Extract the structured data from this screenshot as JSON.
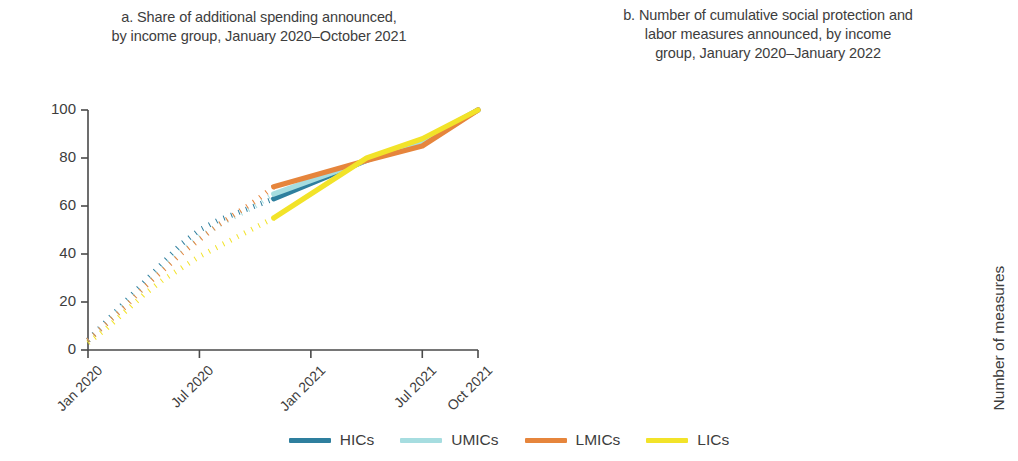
{
  "figure": {
    "background": "#ffffff"
  },
  "colors": {
    "HICs": "#2e7f9e",
    "UMICs": "#a6dde0",
    "LMICs": "#e6853c",
    "LICs": "#f2e329",
    "axis": "#4a4a4a",
    "text": "#3d3d3d"
  },
  "legend": {
    "position": "bottom-center",
    "items": [
      {
        "label": "HICs",
        "color": "#2e7f9e"
      },
      {
        "label": "UMICs",
        "color": "#a6dde0"
      },
      {
        "label": "LMICs",
        "color": "#e6853c"
      },
      {
        "label": "LICs",
        "color": "#f2e329"
      }
    ]
  },
  "panels": {
    "a": {
      "title_line1": "a. Share of additional spending announced,",
      "title_line2": "by income group, January 2020–October 2021"
    },
    "b": {
      "title_line1": "b. Number of cumulative social protection and",
      "title_line2": "labor measures announced, by income",
      "title_line3": "group, January 2020–January 2022"
    }
  },
  "chart_data": [
    {
      "id": "panel-a",
      "type": "line",
      "title": "a. Share of additional spending announced, by income group, January 2020–October 2021",
      "xlabel": "",
      "ylabel": "Share of total announced (%)",
      "ylim": [
        0,
        100
      ],
      "yticks": [
        0,
        20,
        40,
        60,
        80,
        100
      ],
      "ytick_labels": [
        "0",
        "20",
        "40",
        "60",
        "80",
        "100"
      ],
      "xlim": [
        0,
        21
      ],
      "xticks": [
        0,
        6,
        12,
        18,
        21
      ],
      "xtick_labels": [
        "Jan 2020",
        "Jul 2020",
        "Jan 2021",
        "Jul 2021",
        "Oct 2021"
      ],
      "grid": false,
      "note": "Months 0–10 drawn dotted (estimated), months 10–21 drawn solid.",
      "dash_break_month": 10,
      "series": [
        {
          "name": "HICs",
          "color": "#2e7f9e",
          "x": [
            0,
            1,
            2,
            3,
            4,
            5,
            6,
            7,
            8,
            9,
            10,
            15,
            18,
            21
          ],
          "values": [
            4,
            12,
            20,
            28,
            36,
            44,
            50,
            54,
            57,
            60,
            63,
            79,
            87,
            100
          ]
        },
        {
          "name": "UMICs",
          "color": "#a6dde0",
          "x": [
            0,
            1,
            2,
            3,
            4,
            5,
            6,
            7,
            8,
            9,
            10,
            15,
            18,
            21
          ],
          "values": [
            4,
            11,
            19,
            26,
            34,
            41,
            47,
            52,
            56,
            60,
            65,
            79,
            87,
            100
          ]
        },
        {
          "name": "LMICs",
          "color": "#e6853c",
          "x": [
            0,
            1,
            2,
            3,
            4,
            5,
            6,
            7,
            8,
            9,
            10,
            15,
            18,
            21
          ],
          "values": [
            4,
            11,
            18,
            26,
            33,
            40,
            46,
            52,
            57,
            62,
            68,
            79,
            85,
            100
          ]
        },
        {
          "name": "LICs",
          "color": "#f2e329",
          "x": [
            0,
            1,
            2,
            3,
            4,
            5,
            6,
            7,
            8,
            9,
            10,
            15,
            18,
            21
          ],
          "values": [
            3,
            9,
            16,
            23,
            29,
            34,
            39,
            43,
            47,
            51,
            55,
            80,
            88,
            100
          ]
        }
      ]
    },
    {
      "id": "panel-b",
      "type": "line",
      "title": "b. Number of cumulative social protection and labor measures announced, by income group, January 2020–January 2022",
      "xlabel": "",
      "ylabel": "Number of measures",
      "ylim": [
        0,
        1500
      ],
      "yticks": [
        0,
        500,
        1000,
        1500
      ],
      "ytick_labels": [
        "0",
        "500",
        "1,000",
        "1,500"
      ],
      "xlim": [
        0,
        24
      ],
      "xticks": [
        0,
        6,
        12,
        18,
        24
      ],
      "xtick_labels": [
        "Jan 2020",
        "Jul 2020",
        "Jan 2021",
        "Jul 2020",
        "Jan 2022"
      ],
      "grid": false,
      "series": [
        {
          "name": "HICs",
          "label": "HICs (N = 81)",
          "n": 81,
          "color": "#2e7f9e",
          "x": [
            0,
            1,
            2,
            3,
            4,
            5,
            6,
            7,
            8,
            9,
            10,
            11,
            12,
            13,
            14,
            15,
            16,
            17,
            18,
            19,
            20,
            21,
            22,
            23
          ],
          "values": [
            10,
            25,
            120,
            700,
            800,
            870,
            920,
            960,
            985,
            1010,
            1030,
            1050,
            1190,
            1215,
            1240,
            1290,
            1330,
            1345,
            1355,
            1370,
            1385,
            1395,
            1420,
            1430
          ]
        },
        {
          "name": "UMICs",
          "label": "UMICs (N = 59)",
          "n": 59,
          "color": "#a6dde0",
          "x": [
            0,
            1,
            2,
            3,
            4,
            5,
            6,
            7,
            8,
            9,
            10,
            11,
            12,
            13,
            14,
            15,
            16,
            17,
            18,
            19,
            20,
            21,
            22,
            23
          ],
          "values": [
            8,
            20,
            90,
            545,
            620,
            680,
            720,
            750,
            775,
            795,
            815,
            835,
            930,
            985,
            1030,
            1055,
            1075,
            1090,
            1100,
            1110,
            1120,
            1130,
            1140,
            1150
          ]
        },
        {
          "name": "LMICs",
          "label": "LMICs (N = 47)",
          "n": 47,
          "color": "#e6853c",
          "x": [
            0,
            1,
            2,
            3,
            4,
            5,
            6,
            7,
            8,
            9,
            10,
            11,
            12,
            13,
            14,
            15,
            16,
            17,
            18,
            19,
            20,
            21,
            22,
            23
          ],
          "values": [
            6,
            18,
            70,
            370,
            395,
            420,
            445,
            465,
            480,
            495,
            505,
            515,
            565,
            580,
            595,
            615,
            635,
            650,
            665,
            675,
            690,
            700,
            710,
            720
          ]
        },
        {
          "name": "LICs",
          "label": "LICs (N = 28)",
          "n": 28,
          "color": "#f2e329",
          "x": [
            0,
            1,
            2,
            3,
            4,
            5,
            6,
            7,
            8,
            9,
            10,
            11,
            12,
            13,
            14,
            15,
            16,
            17,
            18,
            19,
            20,
            21,
            22,
            23
          ],
          "values": [
            3,
            10,
            40,
            170,
            190,
            205,
            220,
            230,
            240,
            250,
            255,
            262,
            275,
            285,
            295,
            305,
            312,
            318,
            322,
            328,
            332,
            336,
            340,
            344
          ]
        }
      ],
      "series_labels": [
        {
          "text_prefix": "HICs (",
          "text_n": "N",
          "text_suffix": " = 81)"
        },
        {
          "text_prefix": "UMICs (",
          "text_n": "N",
          "text_suffix": " = 59)"
        },
        {
          "text_prefix": "LMICs (",
          "text_n": "N",
          "text_suffix": " = 47)"
        },
        {
          "text_prefix": "LICs (",
          "text_n": "N",
          "text_suffix": " = 28)"
        }
      ]
    }
  ]
}
